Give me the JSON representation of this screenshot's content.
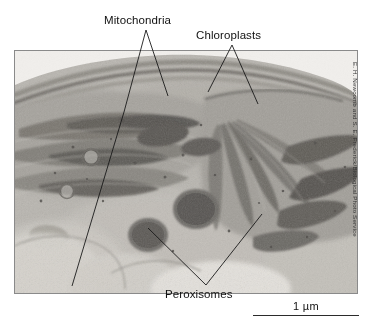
{
  "figure": {
    "type": "transmission-electron-micrograph",
    "background_color": "#ffffff",
    "frame_border_color": "#8a8a8a"
  },
  "labels": {
    "mitochondria": "Mitochondria",
    "chloroplasts": "Chloroplasts",
    "peroxisomes": "Peroxisomes"
  },
  "scale_bar": {
    "label": "1 µm",
    "length_px": 106
  },
  "credit": {
    "text": "E. H. Newcomb and S. E. Frederick/Biological Photo Service"
  },
  "micrograph": {
    "alt": "grayscale electron micrograph of plant cell showing chloroplasts with stacked thylakoid membranes, mitochondria and dark round peroxisomes",
    "tone_light": "#d8d6d1",
    "tone_mid": "#a8a59f",
    "tone_dark": "#6e6b66",
    "tone_darkest": "#4a4744"
  }
}
